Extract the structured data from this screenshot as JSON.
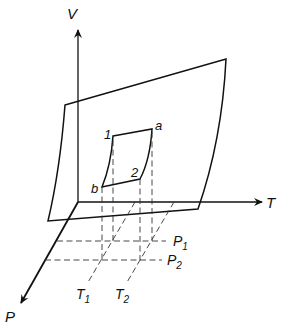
{
  "figure": {
    "type": "3D P-V-T state surface with closed cycle and isobar/isotherm projections",
    "axes": {
      "v_label": "V",
      "t_label": "T",
      "p_label": "P"
    },
    "cycle_points": {
      "p1": "1",
      "pa": "a",
      "p2": "2",
      "pb": "b"
    },
    "isobars": [
      {
        "base": "P",
        "sub": "1"
      },
      {
        "base": "P",
        "sub": "2"
      }
    ],
    "isotherms": [
      {
        "base": "T",
        "sub": "1"
      },
      {
        "base": "T",
        "sub": "2"
      }
    ],
    "colors": {
      "ink": "#111111",
      "background": "#ffffff"
    }
  }
}
